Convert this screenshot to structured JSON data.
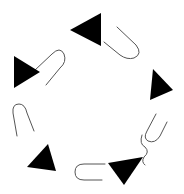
{
  "canvas": {
    "width": 184,
    "height": 194,
    "background": "#ffffff"
  },
  "colors": {
    "triangle_fill": "#000000",
    "clip_stroke": "#555555"
  },
  "triangles": [
    {
      "id": "t1",
      "points": "101,13 101,46 70,30"
    },
    {
      "id": "t2",
      "points": "14,56 14,88 40,72"
    },
    {
      "id": "t3",
      "points": "153,69 150,100 173,90"
    },
    {
      "id": "t4",
      "points": "27,167 48,144 56,171"
    },
    {
      "id": "t5",
      "points": "108,163 143,157 124,185"
    }
  ],
  "paperclips": [
    {
      "id": "c1",
      "d": "M34,71 L52,54 Q60,46 64,54 Q67,62 60,68 L46,85"
    },
    {
      "id": "c2",
      "d": "M117,27 L136,45 Q143,54 134,58 Q127,60 120,55 L104,42"
    },
    {
      "id": "c3",
      "d": "M17,136 L13,113 Q12,104 19,104 Q25,104 27,113 L34,131"
    },
    {
      "id": "c4",
      "d": "M105,164 L84,164 Q75,164 75,172 Q75,180 84,180 L102,180"
    },
    {
      "id": "c5",
      "d": "M156,114 L147,131 Q143,138 148,141 Q155,144 160,136 L167,122 M142,135 Q139,144 145,147 Q150,152 144,157 Q141,162 145,165"
    }
  ]
}
